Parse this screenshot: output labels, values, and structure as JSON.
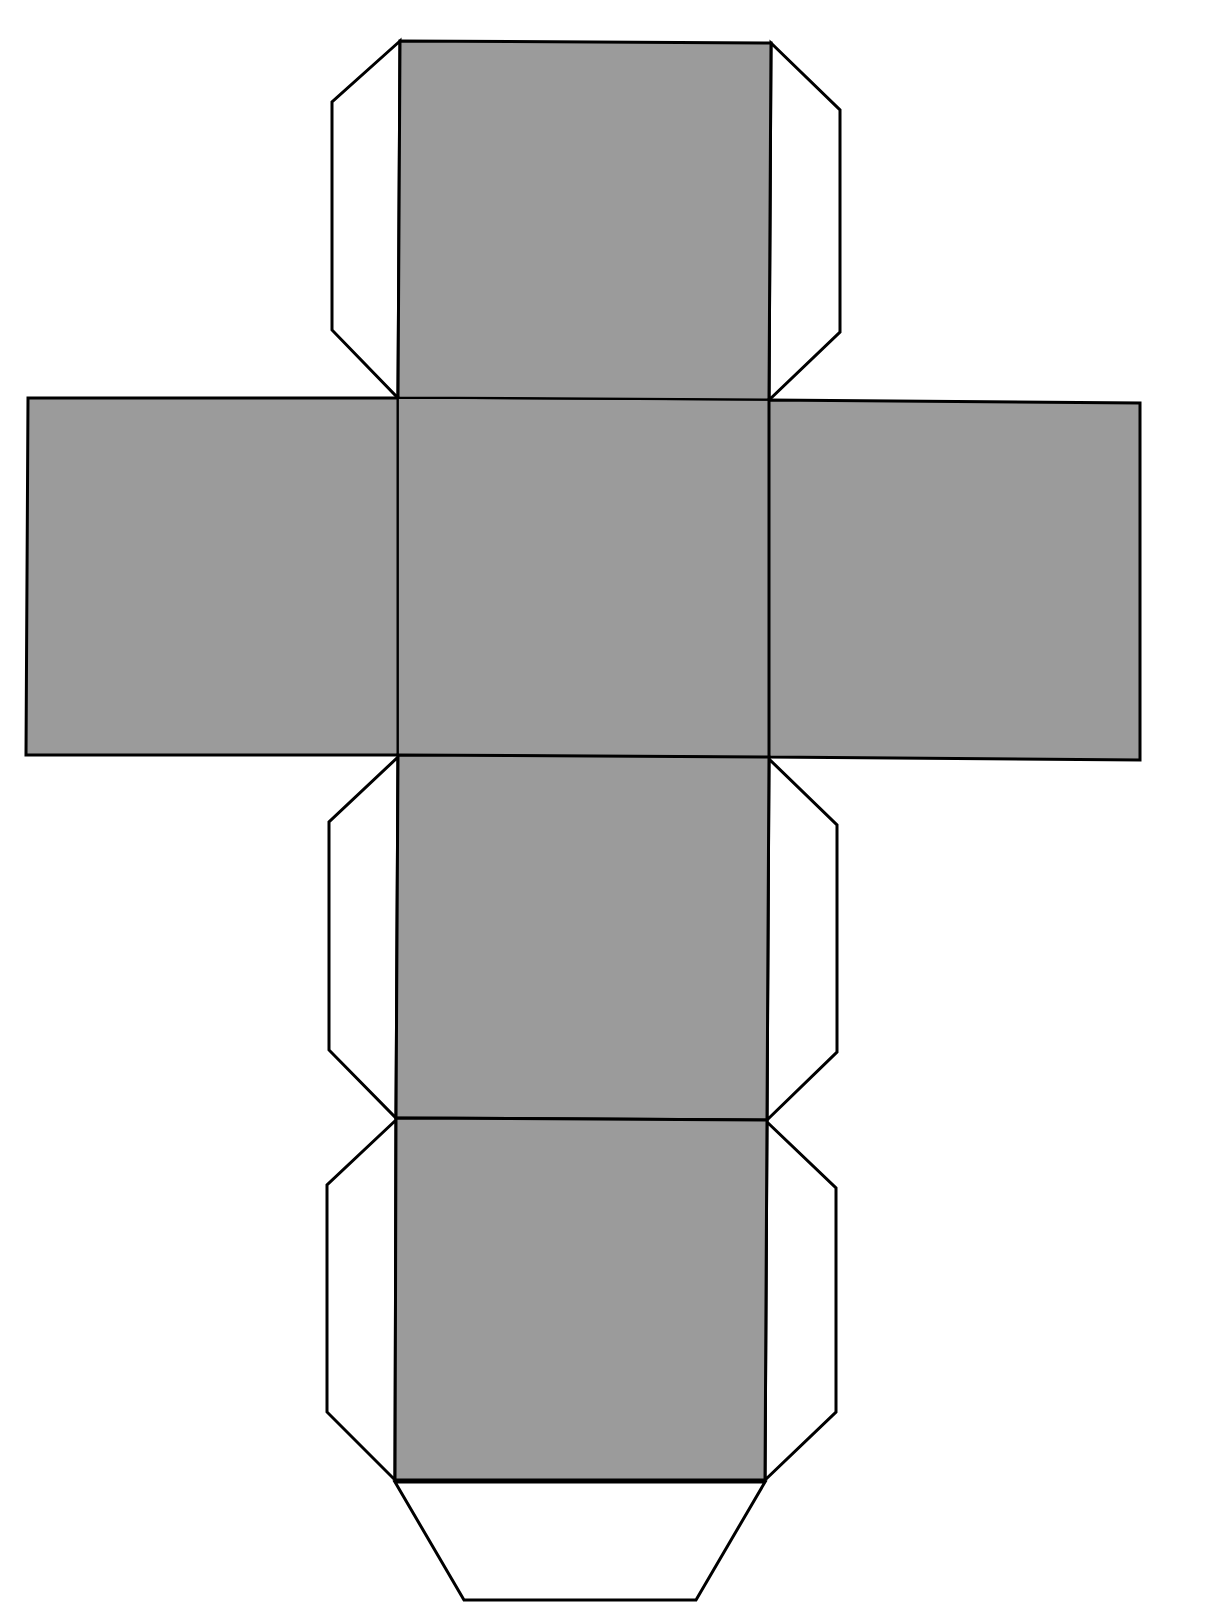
{
  "diagram": {
    "type": "cube-net",
    "colors": {
      "face_fill": "#9b9b9b",
      "tab_fill": "#ffffff",
      "stroke": "#000000",
      "background": "#ffffff"
    },
    "faces": [
      {
        "name": "top-face",
        "points": "400,41 771,43 769,400 398,398"
      },
      {
        "name": "left-face",
        "points": "28,398 398,398 398,755 26,755"
      },
      {
        "name": "center-face",
        "points": "398,398 769,400 769,757 398,755"
      },
      {
        "name": "right-face",
        "points": "769,400 1140,403 1140,760 769,757"
      },
      {
        "name": "lower-face",
        "points": "398,755 769,757 767,1120 396,1118"
      },
      {
        "name": "bottom-face",
        "points": "396,1118 767,1120 765,1480 395,1480"
      }
    ],
    "tabs": [
      {
        "name": "top-left-tab",
        "points": "400,41 332,102 332,330 398,398"
      },
      {
        "name": "top-right-tab",
        "points": "771,43 840,110 840,332 769,400"
      },
      {
        "name": "lower-left-tab",
        "points": "398,757 329,822 329,1050 396,1118"
      },
      {
        "name": "lower-right-tab",
        "points": "769,759 837,825 837,1052 767,1120"
      },
      {
        "name": "bottom-left-tab",
        "points": "396,1120 327,1185 327,1412 395,1480"
      },
      {
        "name": "bottom-right-tab",
        "points": "767,1122 836,1188 836,1412 765,1480"
      },
      {
        "name": "bottom-tab",
        "points": "395,1482 464,1600 696,1600 765,1482"
      }
    ]
  }
}
